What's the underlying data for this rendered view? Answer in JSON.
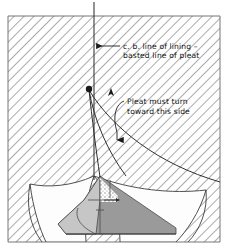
{
  "figure": {
    "type": "technical-illustration",
    "background_color": "#ffffff",
    "frame": {
      "left": 8,
      "top": 16,
      "right": 220,
      "bottom": 242,
      "border_color": "#555555"
    },
    "hatching": {
      "name": "diagonal-hatch-fill",
      "color": "#8c8c8c",
      "angle_deg": 45,
      "spacing_px": 7
    }
  },
  "annotations": [
    {
      "id": "cb-line-callout",
      "line1": "c. b. line of lining –",
      "line2": "basted line of pleat",
      "text_x": 123,
      "text_y1": 46,
      "text_y2": 55,
      "leader": {
        "type": "horizontal-arrow",
        "from_x": 120,
        "to_x": 95,
        "y": 46,
        "arrow_direction": "left"
      }
    },
    {
      "id": "pleat-turn-callout",
      "line1": "Pleat must turn",
      "line2": "toward this side",
      "text_x": 126,
      "text_y1": 101,
      "text_y2": 111,
      "leader": {
        "type": "curved-arrow",
        "arrow_direction": "down",
        "tip_x": 118,
        "tip_y": 147
      }
    }
  ],
  "markers": [
    {
      "id": "pleat-pivot-dot",
      "name": "basting-point-dot",
      "shape": "filled-circle",
      "x": 89,
      "y": 89,
      "r": 3.2,
      "color": "#1a1a1a"
    },
    {
      "id": "small-up-arrow",
      "name": "fold-direction-arrow",
      "shape": "arrowhead",
      "x": 111,
      "y": 93,
      "direction": "up",
      "color": "#1a1a1a"
    }
  ],
  "guides": {
    "center_back_line": {
      "name": "center-back-vertical-line",
      "x": 94,
      "y_top": 2,
      "y_bottom": 180,
      "color": "#3a3a3a",
      "width": 1.1
    }
  },
  "shapes": {
    "fabric_dark": {
      "name": "pleat-underlay-shading",
      "fill": "#9a9a9a",
      "stroke": "#4a4a4a"
    },
    "fabric_mid": {
      "name": "lining-shading",
      "fill": "#c6c6c6",
      "stroke": "#4a4a4a"
    },
    "fabric_light": {
      "name": "drape-panel",
      "fill": "#fcfcfc",
      "stroke": "#3c3c3c"
    },
    "stipple": {
      "name": "stipple-texture-patch",
      "fill": "#b8b8b8"
    }
  },
  "curves": [
    {
      "id": "pleat-fold-curve-left",
      "name": "pleat-fold-line",
      "color": "#2f2f2f"
    },
    {
      "id": "pleat-fold-curve-right",
      "name": "pleat-edge-line",
      "color": "#2f2f2f"
    }
  ]
}
